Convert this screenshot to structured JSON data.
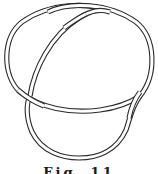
{
  "figure": {
    "caption": "Fig. 11",
    "caption_truncated": true,
    "style": {
      "stroke_color": "#2a2a2a",
      "background": "#ffffff",
      "rendering": "double-line tube"
    },
    "crossings": [
      {
        "position": "top",
        "over_strand": "bottom-left to top-right"
      },
      {
        "position": "left",
        "over_strand": "diagonal from upper-left going down-right"
      },
      {
        "position": "right",
        "over_strand": "vertical strand from right lobe"
      }
    ]
  }
}
